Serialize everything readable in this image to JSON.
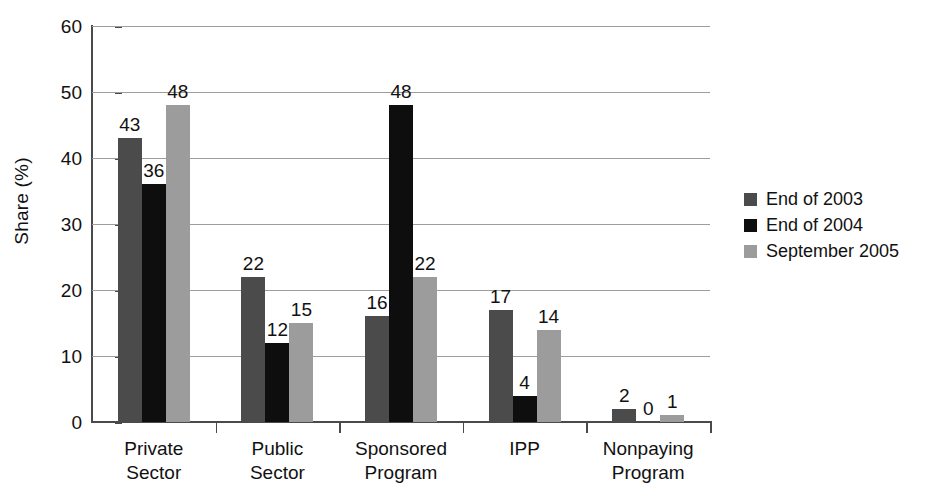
{
  "chart_data": {
    "type": "bar",
    "title": "",
    "subtitle": "",
    "xlabel": "",
    "ylabel": "Share (%)",
    "ylim": [
      0,
      60
    ],
    "ytick_step": 10,
    "yticks": [
      0,
      10,
      20,
      30,
      40,
      50,
      60
    ],
    "ytick_labels": [
      "0",
      "10",
      "20",
      "30",
      "40",
      "50",
      "60"
    ],
    "grid": "horizontal",
    "legend_position": "right",
    "categories": [
      "Private Sector",
      "Public Sector",
      "Sponsored Program",
      "IPP",
      "Nonpaying Program"
    ],
    "category_lines": [
      [
        "Private",
        "Sector"
      ],
      [
        "Public",
        "Sector"
      ],
      [
        "Sponsored",
        "Program"
      ],
      [
        "IPP",
        ""
      ],
      [
        "Nonpaying",
        "Program"
      ]
    ],
    "series": [
      {
        "name": "End of 2003",
        "color": "#4b4b4b",
        "values": [
          43,
          22,
          16,
          17,
          2
        ]
      },
      {
        "name": "End of 2004",
        "color": "#0e0e0e",
        "values": [
          36,
          12,
          48,
          4,
          0
        ]
      },
      {
        "name": "September 2005",
        "color": "#9c9c9c",
        "values": [
          48,
          15,
          22,
          14,
          1
        ]
      }
    ],
    "value_labels": [
      [
        "43",
        "36",
        "48"
      ],
      [
        "22",
        "12",
        "15"
      ],
      [
        "16",
        "48",
        "22"
      ],
      [
        "17",
        "4",
        "14"
      ],
      [
        "2",
        "0",
        "1"
      ]
    ],
    "annotations": []
  },
  "legend": {
    "entries": [
      {
        "label": "End of 2003"
      },
      {
        "label": "End of 2004"
      },
      {
        "label": "September 2005"
      }
    ]
  }
}
